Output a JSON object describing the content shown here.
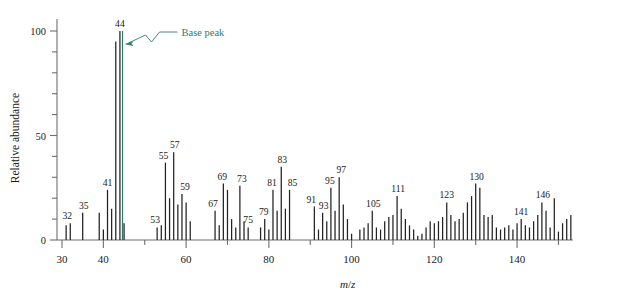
{
  "figure": {
    "type": "mass-spectrum",
    "background_color": "#ffffff",
    "stem_color": "#222222",
    "accent_color": "#2e7d6b",
    "axis_color": "#6f6f6f"
  },
  "axes": {
    "ylabel": "Relative abundance",
    "xlabel_italic_m": "m",
    "xlabel_slash": "/",
    "xlabel_italic_z": "z",
    "xlabel": "m/z",
    "y_ticks_labeled": [
      "0",
      "50",
      "100"
    ],
    "y_tick_values": [
      0,
      10,
      20,
      30,
      40,
      50,
      60,
      70,
      80,
      90,
      100
    ],
    "y_labeled_values": [
      0,
      50,
      100
    ],
    "x_ticks_labeled": [
      "30",
      "40",
      "60",
      "80",
      "100",
      "120",
      "140"
    ],
    "x_labeled_values": [
      30,
      40,
      60,
      80,
      100,
      120,
      140
    ],
    "x_minor_values": [
      50,
      70,
      90,
      110,
      130,
      150
    ],
    "ylim": [
      0,
      104
    ],
    "xlim": [
      28.5,
      153.5
    ],
    "grid": false
  },
  "annotations": [
    {
      "name": "base-peak-callout",
      "text": "Base peak",
      "color": "#2e7d6b",
      "points_to_mz": 44
    }
  ],
  "chart_data": {
    "type": "bar",
    "title": "",
    "subtitle": "",
    "xlabel": "m/z",
    "ylabel": "Relative abundance",
    "xlim": [
      28.5,
      153.5
    ],
    "ylim": [
      0,
      104
    ],
    "grid": false,
    "legend": null,
    "base_peak_mz": 44,
    "base_peak_value": 100,
    "categories": [
      29,
      30,
      31,
      32,
      33,
      34,
      35,
      36,
      37,
      38,
      39,
      40,
      41,
      42,
      43,
      44,
      45,
      46,
      47,
      48,
      49,
      50,
      51,
      52,
      53,
      54,
      55,
      56,
      57,
      58,
      59,
      60,
      61,
      62,
      63,
      64,
      65,
      66,
      67,
      68,
      69,
      70,
      71,
      72,
      73,
      74,
      75,
      76,
      77,
      78,
      79,
      80,
      81,
      82,
      83,
      84,
      85,
      86,
      87,
      88,
      89,
      90,
      91,
      92,
      93,
      94,
      95,
      96,
      97,
      98,
      99,
      100,
      101,
      102,
      103,
      104,
      105,
      106,
      107,
      108,
      109,
      110,
      111,
      112,
      113,
      114,
      115,
      116,
      117,
      118,
      119,
      120,
      121,
      122,
      123,
      124,
      125,
      126,
      127,
      128,
      129,
      130,
      131,
      132,
      133,
      134,
      135,
      136,
      137,
      138,
      139,
      140,
      141,
      142,
      143,
      144,
      145,
      146,
      147,
      148,
      149,
      150,
      151,
      152,
      153
    ],
    "values": [
      0,
      0,
      7,
      8,
      0,
      0,
      13,
      0,
      0,
      0,
      13,
      5,
      24,
      15,
      95,
      100,
      8,
      0,
      0,
      0,
      0,
      0,
      0,
      0,
      6,
      7,
      37,
      20,
      42,
      17,
      22,
      18,
      9,
      0,
      0,
      0,
      0,
      0,
      14,
      7,
      27,
      24,
      10,
      6,
      26,
      9,
      6,
      0,
      0,
      6,
      10,
      5,
      24,
      14,
      35,
      15,
      24,
      0,
      0,
      0,
      0,
      0,
      16,
      5,
      13,
      9,
      25,
      14,
      30,
      17,
      10,
      3,
      0,
      5,
      6,
      8,
      14,
      6,
      5,
      9,
      11,
      12,
      21,
      15,
      10,
      7,
      5,
      2,
      3,
      6,
      9,
      8,
      9,
      11,
      18,
      12,
      9,
      10,
      13,
      18,
      21,
      27,
      25,
      12,
      11,
      12,
      6,
      5,
      6,
      7,
      5,
      8,
      10,
      7,
      6,
      9,
      12,
      18,
      14,
      6,
      20,
      4,
      8,
      10,
      12
    ],
    "labeled_peaks": [
      {
        "mz": 32,
        "label": "32",
        "value": 8
      },
      {
        "mz": 35,
        "label": "35",
        "value": 13
      },
      {
        "mz": 41,
        "label": "41",
        "value": 24
      },
      {
        "mz": 44,
        "label": "44",
        "value": 100
      },
      {
        "mz": 53,
        "label": "53",
        "value": 6
      },
      {
        "mz": 55,
        "label": "55",
        "value": 37
      },
      {
        "mz": 57,
        "label": "57",
        "value": 42
      },
      {
        "mz": 59,
        "label": "59",
        "value": 22
      },
      {
        "mz": 67,
        "label": "67",
        "value": 14
      },
      {
        "mz": 69,
        "label": "69",
        "value": 27
      },
      {
        "mz": 73,
        "label": "73",
        "value": 26
      },
      {
        "mz": 75,
        "label": "75",
        "value": 6
      },
      {
        "mz": 79,
        "label": "79",
        "value": 10
      },
      {
        "mz": 81,
        "label": "81",
        "value": 24
      },
      {
        "mz": 83,
        "label": "83",
        "value": 35
      },
      {
        "mz": 85,
        "label": "85",
        "value": 24
      },
      {
        "mz": 91,
        "label": "91",
        "value": 16
      },
      {
        "mz": 93,
        "label": "93",
        "value": 13
      },
      {
        "mz": 95,
        "label": "95",
        "value": 25
      },
      {
        "mz": 97,
        "label": "97",
        "value": 30
      },
      {
        "mz": 105,
        "label": "105",
        "value": 14
      },
      {
        "mz": 111,
        "label": "111",
        "value": 21
      },
      {
        "mz": 123,
        "label": "123",
        "value": 18
      },
      {
        "mz": 130,
        "label": "130",
        "value": 27
      },
      {
        "mz": 141,
        "label": "141",
        "value": 10
      },
      {
        "mz": 146,
        "label": "146",
        "value": 18
      }
    ]
  }
}
